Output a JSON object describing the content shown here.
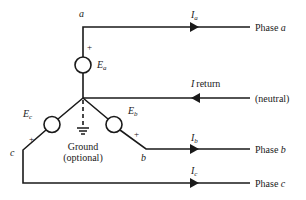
{
  "diagram": {
    "nodes": {
      "a": "a",
      "b": "b",
      "c": "c"
    },
    "sources": {
      "ea": "E",
      "ea_sub": "a",
      "eb": "E",
      "eb_sub": "b",
      "ec": "E",
      "ec_sub": "c",
      "plus": "+"
    },
    "currents": {
      "ia": "I",
      "ia_sub": "a",
      "ib": "I",
      "ib_sub": "b",
      "ic": "I",
      "ic_sub": "c",
      "ireturn": "I",
      "ireturn_sub": "return"
    },
    "lines": {
      "phase_a": "Phase a",
      "phase_a_prefix": "Phase",
      "phase_a_letter": "a",
      "neutral": "(neutral)",
      "phase_b_prefix": "Phase",
      "phase_b_letter": "b",
      "phase_c_prefix": "Phase",
      "phase_c_letter": "c"
    },
    "ground": {
      "line1": "Ground",
      "line2": "(optional)"
    },
    "colors": {
      "stroke": "#1a1a1a",
      "background": "#ffffff"
    }
  }
}
